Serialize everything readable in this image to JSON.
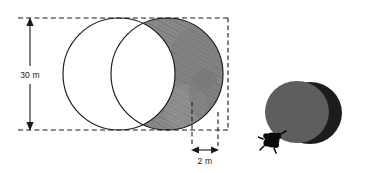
{
  "figure": {
    "title": "Crescent-shaped region formed by two overlapping circles",
    "background_color": "#ffffff",
    "stroke_color": "#1a1a1a",
    "dimension_labels": {
      "vertical": "30 m",
      "horizontal": "2 m"
    },
    "left_diagram": {
      "name": "overlapping-circles-diagram",
      "circle_back": {
        "name": "left-circle",
        "cx": 119,
        "cy": 74,
        "r": 56,
        "fill": "#ffffff",
        "stroke": "#1a1a1a"
      },
      "circle_front": {
        "name": "right-circle",
        "cx": 167,
        "cy": 74,
        "r": 56,
        "fill": "#ffffff",
        "stroke": "#1a1a1a"
      },
      "crescent": {
        "name": "shaded-crescent",
        "fill": "#8e8e8e",
        "description": "region inside right circle and outside left circle"
      },
      "vertical_dimension": {
        "name": "height-dimension",
        "x": 30,
        "y_top": 18,
        "y_bottom": 130,
        "value": "30 m"
      },
      "horizontal_dimension": {
        "name": "width-dimension",
        "y": 150,
        "x_left": 192,
        "x_right": 218,
        "value": "2 m"
      },
      "extension_lines": {
        "name": "dashed-extension-lines",
        "top_y": 18,
        "bottom_y": 130,
        "left_x": 18,
        "right_x": 228,
        "style": "dashed"
      }
    },
    "right_diagram": {
      "name": "shaded-discs-illustration",
      "back_disc": {
        "name": "back-dark-disc",
        "cx": 310,
        "cy": 113,
        "rx": 32,
        "ry": 31,
        "fill": "#1c1c1c"
      },
      "front_disc": {
        "name": "front-gray-disc",
        "cx": 297,
        "cy": 112,
        "rx": 32,
        "ry": 31,
        "fill": "#5e5e5e"
      },
      "blob": {
        "name": "black-blob-marker",
        "cx": 272,
        "cy": 140,
        "r": 7,
        "fill": "#0b0b0b"
      }
    }
  }
}
